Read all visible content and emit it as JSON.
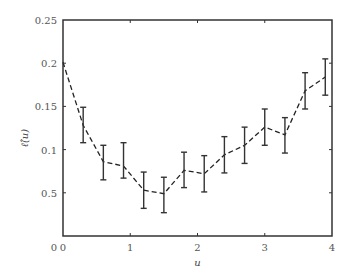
{
  "chart_data": {
    "type": "line",
    "title": "",
    "xlabel": "u",
    "ylabel": "ℓ̂(u)",
    "xlim": [
      0,
      4
    ],
    "ylim": [
      0,
      0.25
    ],
    "grid": false,
    "legend": null,
    "x_ticks": [
      {
        "value": 0,
        "label": "0"
      },
      {
        "value": 1,
        "label": "1"
      },
      {
        "value": 2,
        "label": "2"
      },
      {
        "value": 3,
        "label": "3"
      },
      {
        "value": 4,
        "label": "4"
      }
    ],
    "y_ticks": [
      {
        "value": 0,
        "label": "0"
      },
      {
        "value": 0.05,
        "label": "0.5"
      },
      {
        "value": 0.1,
        "label": "0.1"
      },
      {
        "value": 0.15,
        "label": "0.15"
      },
      {
        "value": 0.2,
        "label": "0.2"
      },
      {
        "value": 0.25,
        "label": "0.25"
      }
    ],
    "series": [
      {
        "name": "estimate",
        "style": "dashed",
        "color": "#222222",
        "x": [
          0,
          0.3,
          0.6,
          0.9,
          1.2,
          1.5,
          1.8,
          2.1,
          2.4,
          2.7,
          3.0,
          3.3,
          3.6,
          3.9
        ],
        "y": [
          0.201,
          0.128,
          0.086,
          0.081,
          0.053,
          0.049,
          0.076,
          0.072,
          0.094,
          0.105,
          0.126,
          0.117,
          0.168,
          0.184
        ],
        "err_low": [
          null,
          0.108,
          0.065,
          0.067,
          0.032,
          0.027,
          0.056,
          0.051,
          0.073,
          0.084,
          0.105,
          0.096,
          0.147,
          0.163
        ],
        "err_high": [
          null,
          0.149,
          0.105,
          0.108,
          0.074,
          0.068,
          0.097,
          0.093,
          0.115,
          0.126,
          0.147,
          0.137,
          0.189,
          0.205
        ]
      }
    ]
  },
  "layout": {
    "plot_left": 63,
    "plot_right": 332,
    "plot_top": 20,
    "plot_bottom": 236
  }
}
